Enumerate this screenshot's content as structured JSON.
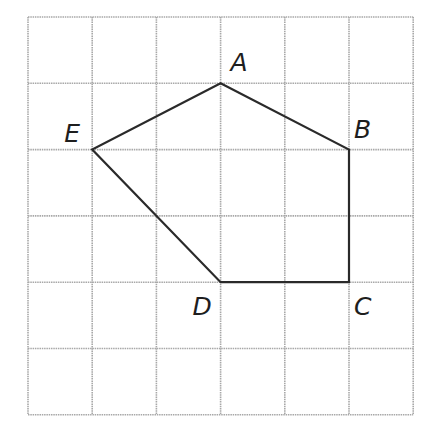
{
  "diagram": {
    "type": "polygon-on-grid",
    "grid": {
      "cols": 6,
      "rows": 6,
      "origin": [
        28,
        17
      ],
      "cell_w": 64.2,
      "cell_h": 66.3,
      "color": "#a8a8a8"
    },
    "polygon": {
      "stroke": "#2a2a2a",
      "vertices": [
        {
          "name": "A",
          "col": 3,
          "row": 1,
          "label_dx": 10,
          "label_dy": -12
        },
        {
          "name": "B",
          "col": 5,
          "row": 2,
          "label_dx": 5,
          "label_dy": -12
        },
        {
          "name": "C",
          "col": 5,
          "row": 4,
          "label_dx": 5,
          "label_dy": 33
        },
        {
          "name": "D",
          "col": 3,
          "row": 4,
          "label_dx": -28,
          "label_dy": 33
        },
        {
          "name": "E",
          "col": 1,
          "row": 2,
          "label_dx": -28,
          "label_dy": -8
        }
      ]
    },
    "labels": {
      "A": "A",
      "B": "B",
      "C": "C",
      "D": "D",
      "E": "E"
    }
  }
}
